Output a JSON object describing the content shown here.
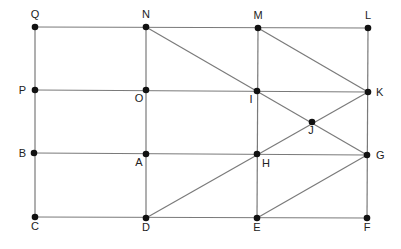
{
  "diagram": {
    "title": "",
    "style": {
      "line_color": "#7a7a7a",
      "point_color": "#111111",
      "label_color": "#222222"
    },
    "points": [
      {
        "id": "Q",
        "x": 35,
        "y": 27,
        "lx": 35,
        "ly": 18,
        "anchor": "middle"
      },
      {
        "id": "N",
        "x": 146,
        "y": 27,
        "lx": 146,
        "ly": 18,
        "anchor": "middle"
      },
      {
        "id": "M",
        "x": 258,
        "y": 28,
        "lx": 258,
        "ly": 19,
        "anchor": "middle"
      },
      {
        "id": "L",
        "x": 368,
        "y": 28,
        "lx": 368,
        "ly": 19,
        "anchor": "middle"
      },
      {
        "id": "P",
        "x": 35,
        "y": 90,
        "lx": 26,
        "ly": 94,
        "anchor": "end"
      },
      {
        "id": "O",
        "x": 146,
        "y": 90,
        "lx": 139,
        "ly": 102,
        "anchor": "middle"
      },
      {
        "id": "I",
        "x": 257,
        "y": 91,
        "lx": 251,
        "ly": 103,
        "anchor": "middle"
      },
      {
        "id": "K",
        "x": 368,
        "y": 92,
        "lx": 376,
        "ly": 96,
        "anchor": "start"
      },
      {
        "id": "J",
        "x": 312,
        "y": 122,
        "lx": 311,
        "ly": 134,
        "anchor": "middle"
      },
      {
        "id": "B",
        "x": 34,
        "y": 153,
        "lx": 26,
        "ly": 157,
        "anchor": "end"
      },
      {
        "id": "A",
        "x": 146,
        "y": 154,
        "lx": 139,
        "ly": 166,
        "anchor": "middle"
      },
      {
        "id": "H",
        "x": 257,
        "y": 154,
        "lx": 266,
        "ly": 167,
        "anchor": "middle"
      },
      {
        "id": "G",
        "x": 367,
        "y": 155,
        "lx": 376,
        "ly": 159,
        "anchor": "start"
      },
      {
        "id": "C",
        "x": 35,
        "y": 217,
        "lx": 35,
        "ly": 230,
        "anchor": "middle"
      },
      {
        "id": "D",
        "x": 146,
        "y": 218,
        "lx": 146,
        "ly": 231,
        "anchor": "middle"
      },
      {
        "id": "E",
        "x": 257,
        "y": 218,
        "lx": 257,
        "ly": 231,
        "anchor": "middle"
      },
      {
        "id": "F",
        "x": 367,
        "y": 218,
        "lx": 367,
        "ly": 231,
        "anchor": "middle"
      }
    ],
    "segments": [
      [
        "Q",
        "L"
      ],
      [
        "P",
        "K"
      ],
      [
        "B",
        "G"
      ],
      [
        "C",
        "F"
      ],
      [
        "Q",
        "C"
      ],
      [
        "N",
        "D"
      ],
      [
        "M",
        "E"
      ],
      [
        "L",
        "F"
      ],
      [
        "N",
        "G"
      ],
      [
        "M",
        "K"
      ],
      [
        "D",
        "K"
      ],
      [
        "E",
        "G"
      ]
    ]
  }
}
